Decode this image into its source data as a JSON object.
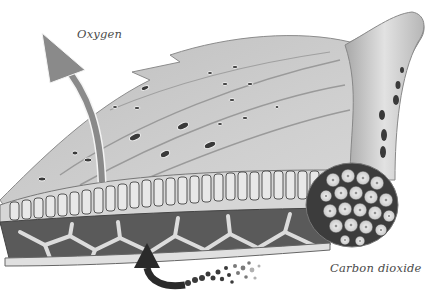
{
  "diagram": {
    "labels": {
      "oxygen": "Oxygen",
      "carbon_dioxide": "Carbon dioxide"
    },
    "arrows": [
      {
        "name": "oxygen-arrow",
        "direction": "out-up",
        "color": "#8a8a8a"
      },
      {
        "name": "carbon-dioxide-arrow",
        "direction": "in-up",
        "color": "#2a2a2a"
      }
    ],
    "colors": {
      "leaf_surface": "#c9c9c9",
      "leaf_shadow": "#9a9a9a",
      "cell_dark": "#4b4b4b",
      "cell_light": "#e4e4e4",
      "background": "#ffffff"
    }
  }
}
